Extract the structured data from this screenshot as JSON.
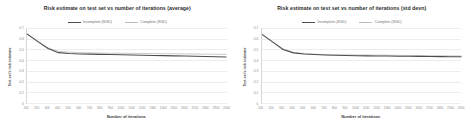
{
  "figure": {
    "background": "#ffffff",
    "panels": [
      "average",
      "std_devn"
    ]
  },
  "colors": {
    "incomplete": "#4d4d4d",
    "complete": "#bdbdbd",
    "grid": "#ededed",
    "axis": "#d7d7d7",
    "tick_text": "#8a8a8a",
    "title_text": "#2b2b2b"
  },
  "chart_data": [
    {
      "type": "line",
      "title": "Risk estimate on test set vs number of iterations (average)",
      "xlabel": "Number of iterations",
      "ylabel": "Test set's risk estimate",
      "grid": true,
      "legend_position": "top-center",
      "xlim": [
        100,
        2000
      ],
      "ylim": [
        0,
        0.7
      ],
      "yticks": [
        "0.7",
        "0.6",
        "0.5",
        "0.4",
        "0.3",
        "0.2",
        "0.1",
        "0"
      ],
      "ytick_values": [
        0.7,
        0.6,
        0.5,
        0.4,
        0.3,
        0.2,
        0.1,
        0
      ],
      "x": [
        100,
        200,
        300,
        400,
        500,
        600,
        700,
        800,
        900,
        1000,
        1100,
        1200,
        1300,
        1400,
        1500,
        1600,
        1700,
        1800,
        1900,
        2000
      ],
      "xticks": [
        "100",
        "200",
        "300",
        "400",
        "500",
        "600",
        "700",
        "800",
        "900",
        "1000",
        "1100",
        "1200",
        "1300",
        "1400",
        "1500",
        "1600",
        "1700",
        "1800",
        "1900",
        "2000"
      ],
      "series": [
        {
          "name": "Incomplete (SGD)",
          "color": "#4d4d4d",
          "values": [
            0.645,
            0.575,
            0.508,
            0.47,
            0.462,
            0.458,
            0.456,
            0.454,
            0.452,
            0.45,
            0.448,
            0.446,
            0.444,
            0.442,
            0.44,
            0.438,
            0.436,
            0.434,
            0.432,
            0.43
          ]
        },
        {
          "name": "Complete (SGD)",
          "color": "#bdbdbd",
          "values": [
            0.645,
            0.578,
            0.515,
            0.482,
            0.474,
            0.47,
            0.468,
            0.466,
            0.465,
            0.464,
            0.463,
            0.462,
            0.461,
            0.46,
            0.459,
            0.458,
            0.457,
            0.456,
            0.455,
            0.454
          ]
        }
      ]
    },
    {
      "type": "line",
      "title": "Risk estimate on test set vs number of iterations (std devn)",
      "xlabel": "Number of iterations",
      "ylabel": "Test set's risk estimate",
      "grid": true,
      "legend_position": "top-center",
      "xlim": [
        100,
        2000
      ],
      "ylim": [
        0,
        0.7
      ],
      "yticks": [
        "0.7",
        "0.6",
        "0.5",
        "0.4",
        "0.3",
        "0.2",
        "0.1",
        "0"
      ],
      "ytick_values": [
        0.7,
        0.6,
        0.5,
        0.4,
        0.3,
        0.2,
        0.1,
        0
      ],
      "x": [
        100,
        200,
        300,
        400,
        500,
        600,
        700,
        800,
        900,
        1000,
        1100,
        1200,
        1300,
        1400,
        1500,
        1600,
        1700,
        1800,
        1900,
        2000
      ],
      "xticks": [
        "100",
        "200",
        "300",
        "400",
        "500",
        "600",
        "700",
        "800",
        "900",
        "1000",
        "1100",
        "1200",
        "1300",
        "1400",
        "1500",
        "1600",
        "1700",
        "1800",
        "1900",
        "2000"
      ],
      "series": [
        {
          "name": "Incomplete (SGD)",
          "color": "#4d4d4d",
          "values": [
            0.64,
            0.57,
            0.5,
            0.468,
            0.458,
            0.452,
            0.448,
            0.445,
            0.443,
            0.441,
            0.44,
            0.439,
            0.438,
            0.437,
            0.436,
            0.435,
            0.434,
            0.433,
            0.432,
            0.431
          ]
        },
        {
          "name": "Complete (SGD)",
          "color": "#bdbdbd",
          "values": [
            0.64,
            0.572,
            0.504,
            0.472,
            0.462,
            0.456,
            0.452,
            0.449,
            0.45,
            0.449,
            0.448,
            0.447,
            0.446,
            0.445,
            0.444,
            0.443,
            0.442,
            0.441,
            0.44,
            0.439
          ]
        }
      ]
    }
  ]
}
